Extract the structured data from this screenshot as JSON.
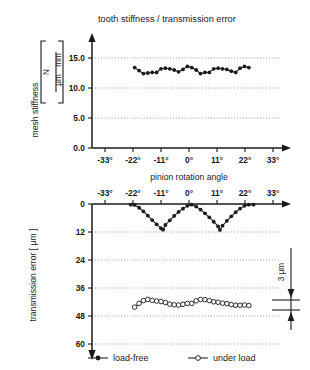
{
  "figure": {
    "title": "tooth stiffness / transmission error",
    "shared_axis_label": "pinion rotation angle"
  },
  "legend": {
    "position": "bottom",
    "items": [
      {
        "label": "load-free",
        "marker": "filled-circle-icon"
      },
      {
        "label": "under load",
        "marker": "open-circle-icon"
      }
    ]
  },
  "annotation": {
    "scale_bar_label": "3 µm",
    "scale_bar_value": 3,
    "scale_bar_unit": "µm"
  },
  "top_axis_units": {
    "numerator": "N",
    "denominator_left": "µm",
    "denominator_right": "mm"
  },
  "chart_data": [
    {
      "type": "line",
      "id": "mesh-stiffness-chart",
      "title": "tooth stiffness / transmission error",
      "xlabel": "pinion rotation angle",
      "ylabel": "mesh stiffness",
      "yunit": "N / (µm mm)",
      "xlim": [
        -38.5,
        38.5
      ],
      "ylim": [
        0.0,
        16.5
      ],
      "grid": true,
      "grid_axis": "y",
      "legend_position": "bottom",
      "xticks": [
        -33,
        -22,
        -11,
        0,
        11,
        22,
        33
      ],
      "xticklabels": [
        "-33°",
        "-22°",
        "-11°",
        "0°",
        "11°",
        "22°",
        "33°"
      ],
      "yticks": [
        0.0,
        5.0,
        10.0,
        15.0
      ],
      "yticklabels": [
        "0.0",
        "5.0",
        "10.0",
        "15.0"
      ],
      "series": [
        {
          "name": "load-free",
          "marker": "filled-circle",
          "x": [
            -22.0,
            -20.3,
            -18.6,
            -16.9,
            -15.2,
            -13.5,
            -11.8,
            -10.1,
            -8.4,
            -6.7,
            -5.0,
            -3.3,
            -1.6,
            0.1,
            1.8,
            3.5,
            5.2,
            6.9,
            8.6,
            10.3,
            12.0,
            13.7,
            15.4,
            17.1,
            18.8,
            20.5,
            22.2
          ],
          "y": [
            13.4,
            12.9,
            12.4,
            12.5,
            12.6,
            12.6,
            13.2,
            13.3,
            13.2,
            13.0,
            12.7,
            13.1,
            13.6,
            13.4,
            13.0,
            12.4,
            12.6,
            12.6,
            13.2,
            13.3,
            13.2,
            13.1,
            12.8,
            12.6,
            13.3,
            13.6,
            13.4
          ]
        }
      ]
    },
    {
      "type": "line",
      "id": "transmission-error-chart",
      "title": "",
      "xlabel": "pinion rotation angle",
      "ylabel": "transmission error [ µm ]",
      "yunit": "µm",
      "xlim": [
        -38.5,
        38.5
      ],
      "ylim": [
        0,
        63
      ],
      "y_inverted": true,
      "grid": true,
      "grid_axis": "y",
      "legend_position": "bottom",
      "xticks": [
        -33,
        -22,
        -11,
        0,
        11,
        22,
        33
      ],
      "xticklabels": [
        "-33°",
        "-22°",
        "-11°",
        "0°",
        "11°",
        "22°",
        "33°"
      ],
      "yticks": [
        0,
        12,
        24,
        36,
        48,
        60
      ],
      "yticklabels": [
        "0",
        "12",
        "24",
        "36",
        "48",
        "60"
      ],
      "series": [
        {
          "name": "load-free",
          "marker": "filled-circle",
          "x": [
            -23.5,
            -22.0,
            -20.3,
            -18.6,
            -16.9,
            -15.2,
            -13.5,
            -11.8,
            -11.0,
            -10.1,
            -8.4,
            -6.7,
            -5.0,
            -3.3,
            -1.6,
            0.0,
            1.8,
            3.5,
            5.2,
            6.9,
            8.6,
            10.3,
            11.0,
            12.0,
            13.7,
            15.4,
            17.1,
            18.8,
            20.5,
            22.2,
            24.0
          ],
          "y": [
            0.3,
            0.4,
            1.6,
            3.2,
            5.0,
            6.9,
            8.7,
            10.4,
            11.0,
            9.0,
            7.0,
            5.1,
            3.4,
            2.0,
            0.8,
            0.3,
            1.1,
            2.4,
            4.0,
            5.7,
            7.6,
            9.6,
            11.1,
            9.3,
            7.2,
            5.3,
            3.5,
            2.0,
            0.8,
            0.3,
            0.3
          ]
        },
        {
          "name": "under load",
          "marker": "open-circle",
          "x": [
            -22.0,
            -20.3,
            -18.6,
            -16.9,
            -15.2,
            -13.5,
            -11.8,
            -10.1,
            -8.4,
            -6.7,
            -5.0,
            -3.3,
            -1.6,
            0.1,
            1.8,
            3.5,
            5.2,
            6.9,
            8.6,
            10.3,
            12.0,
            13.7,
            15.4,
            17.1,
            18.8,
            20.5,
            22.2
          ],
          "y": [
            44.2,
            42.6,
            41.4,
            40.9,
            41.3,
            41.6,
            41.8,
            42.2,
            42.9,
            43.2,
            43.3,
            43.0,
            42.6,
            42.6,
            41.5,
            40.9,
            41.0,
            41.4,
            41.9,
            42.1,
            42.5,
            42.7,
            43.1,
            43.4,
            43.4,
            43.3,
            43.5
          ]
        }
      ]
    }
  ]
}
